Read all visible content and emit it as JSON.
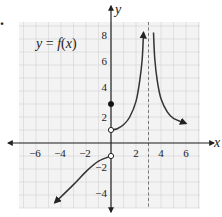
{
  "problem": {
    "marker": "."
  },
  "chart_data": {
    "type": "line",
    "title": "y = f(x)",
    "xlabel": "x",
    "ylabel": "y",
    "xlim": [
      -7,
      7
    ],
    "ylim": [
      -5,
      9
    ],
    "grid": true,
    "x_ticks": [
      -6,
      -4,
      -2,
      2,
      4,
      6
    ],
    "y_ticks": [
      -4,
      -2,
      2,
      4,
      6,
      8
    ],
    "x_tick_labels": [
      "−6",
      "−4",
      "−2",
      "2",
      "4",
      "6"
    ],
    "y_tick_labels": [
      "−4",
      "−2",
      "2",
      "4",
      "6",
      "8"
    ],
    "vertical_asymptote": {
      "x": 3,
      "style": "dashed"
    },
    "series": [
      {
        "name": "left branch",
        "points": [
          [
            -4.5,
            -4.6
          ],
          [
            -3,
            -3.2
          ],
          [
            -2,
            -2.2
          ],
          [
            -1,
            -1.4
          ],
          [
            0,
            -1
          ]
        ],
        "arrow_start": true,
        "end": "open-circle"
      },
      {
        "name": "middle branch",
        "points": [
          [
            0,
            1
          ],
          [
            0.5,
            1.1
          ],
          [
            1,
            1.4
          ],
          [
            1.5,
            2.0
          ],
          [
            2,
            3.2
          ],
          [
            2.3,
            4.8
          ],
          [
            2.5,
            6.5
          ],
          [
            2.6,
            8.5
          ]
        ],
        "start": "open-circle",
        "arrow_end": true
      },
      {
        "name": "right branch",
        "points": [
          [
            3.4,
            8.5
          ],
          [
            3.5,
            6.5
          ],
          [
            3.7,
            4.8
          ],
          [
            4,
            3.4
          ],
          [
            4.5,
            2.4
          ],
          [
            5,
            1.9
          ],
          [
            6,
            1.5
          ]
        ],
        "arrow_end": true
      }
    ],
    "point_markers": [
      {
        "x": 0,
        "y": 3,
        "type": "filled"
      },
      {
        "x": 0,
        "y": 1,
        "type": "open"
      },
      {
        "x": 0,
        "y": -1,
        "type": "open"
      }
    ],
    "annotation": "y = f(x)"
  },
  "labels": {
    "x_axis": "x",
    "y_axis": "y",
    "func_y": "y",
    "func_eq": " = ",
    "func_f": "f",
    "func_paren_open": "(",
    "func_x": "x",
    "func_paren_close": ")",
    "xt": [
      "−6",
      "−4",
      "−2",
      "2",
      "4",
      "6"
    ],
    "yt": [
      "8",
      "6",
      "4",
      "2",
      "−2",
      "−4"
    ]
  }
}
